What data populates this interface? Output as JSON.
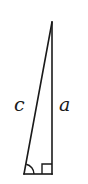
{
  "diagram": {
    "type": "right-triangle",
    "stroke_color": "#1a1a1a",
    "background": "#ffffff",
    "labels": {
      "hypotenuse": "c",
      "vertical_leg": "a"
    },
    "markers": {
      "right_angle": "square-marker",
      "angle_arc": "arc-marker"
    }
  }
}
